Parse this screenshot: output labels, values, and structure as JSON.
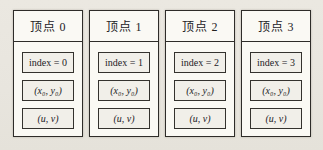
{
  "diagram": {
    "colors": {
      "background": "#e9e6df",
      "card_fill": "#faf9f4",
      "field_fill": "#f1efe9",
      "border": "#2e2c29"
    }
  },
  "cards": [
    {
      "title": "顶点 0",
      "index_label": "index = 0",
      "coords_label": "(x₀, y₀)",
      "uv_label": "(u, v)"
    },
    {
      "title": "顶点 1",
      "index_label": "index = 1",
      "coords_label": "(x₀, y₀)",
      "uv_label": "(u, v)"
    },
    {
      "title": "顶点 2",
      "index_label": "index = 2",
      "coords_label": "(x₀, y₀)",
      "uv_label": "(u, v)"
    },
    {
      "title": "顶点 3",
      "index_label": "index = 3",
      "coords_label": "(x₀, y₀)",
      "uv_label": "(u, v)"
    }
  ]
}
